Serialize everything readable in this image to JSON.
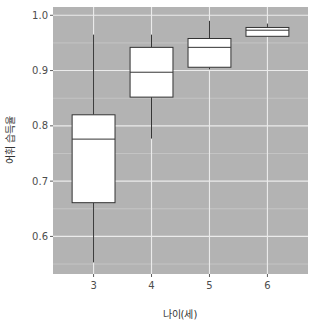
{
  "chart_data": {
    "type": "boxplot",
    "title": "",
    "xlabel": "나이(세)",
    "ylabel": "어휘 습득율",
    "categories": [
      "3",
      "4",
      "5",
      "6"
    ],
    "ylim": [
      0.532,
      1.015
    ],
    "yticks": [
      0.6,
      0.7,
      0.8,
      0.9,
      1.0
    ],
    "ytick_labels": [
      "0.6",
      "0.7",
      "0.8",
      "0.9",
      "1.0"
    ],
    "grid": true,
    "legend": "none",
    "boxes": [
      {
        "category": "3",
        "whisker_low": 0.553,
        "q1": 0.661,
        "median": 0.776,
        "q3": 0.82,
        "whisker_high": 0.965
      },
      {
        "category": "4",
        "whisker_low": 0.777,
        "q1": 0.852,
        "median": 0.897,
        "q3": 0.942,
        "whisker_high": 0.965
      },
      {
        "category": "5",
        "whisker_low": 0.902,
        "q1": 0.906,
        "median": 0.942,
        "q3": 0.958,
        "whisker_high": 0.99
      },
      {
        "category": "6",
        "whisker_low": 0.962,
        "q1": 0.962,
        "median": 0.973,
        "q3": 0.978,
        "whisker_high": 0.985
      }
    ]
  },
  "style": {
    "panel_bg": "#b3b3b3",
    "grid_major": "#ebebeb",
    "grid_minor": "#d0d0d0",
    "box_fill": "#ffffff",
    "box_stroke": "#333333"
  }
}
